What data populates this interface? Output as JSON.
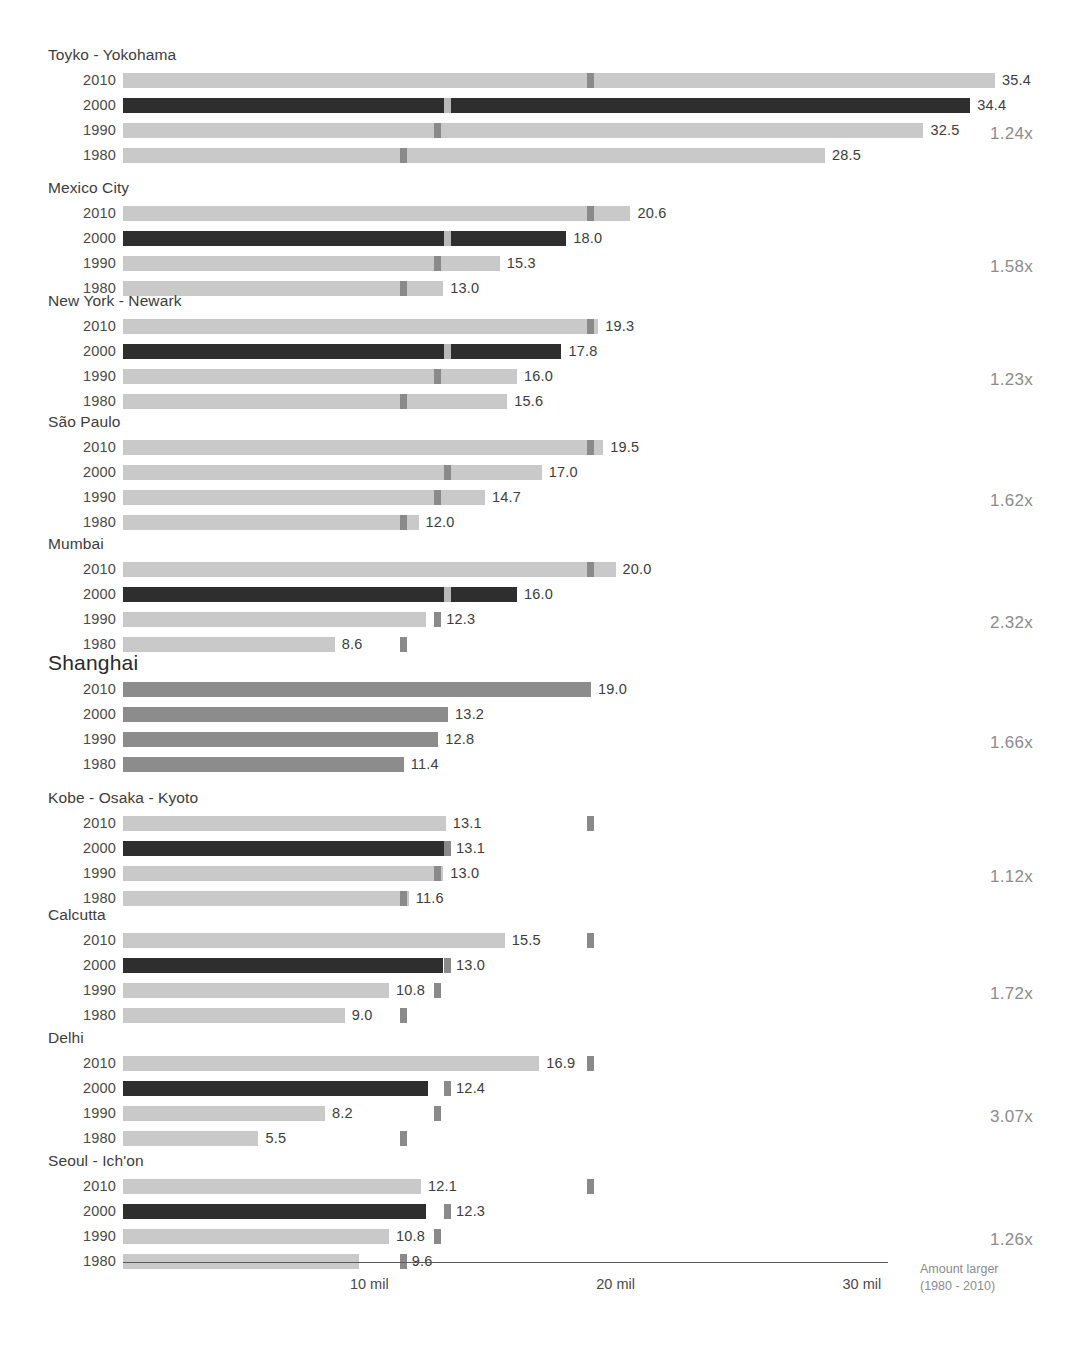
{
  "chart_data": {
    "type": "bar",
    "title": "",
    "xlabel": "",
    "ylabel": "",
    "xlim": [
      0,
      36
    ],
    "grid": false,
    "legend": "none",
    "axis_tick_labels": [
      "10 mil",
      "20 mil",
      "30 mil"
    ],
    "axis_tick_values": [
      10,
      20,
      30
    ],
    "axis_note_line1": "Amount larger",
    "axis_note_line2": "(1980 - 2010)",
    "years": [
      "2010",
      "2000",
      "1990",
      "1980"
    ],
    "reference_city": "Shanghai",
    "reference_values": {
      "2010": 19.0,
      "2000": 13.2,
      "1990": 12.8,
      "1980": 11.4
    },
    "colors": {
      "bar_light": "#c9c9c9",
      "bar_light_alt": "#c2c2c2",
      "bar_dark": "#2e2e2e",
      "bar_highlight": "#8c8c8c",
      "marker": "#8a8a8a",
      "marker_on_dark": "#b9b9b9",
      "text": "#3d3d3d",
      "muted": "#8c8c8c",
      "axis": "#5a5a5a"
    },
    "groups": [
      {
        "city": "Toyko - Yokohama",
        "highlight": false,
        "multiplier": "1.24x",
        "rows": [
          {
            "year": "2010",
            "value": 35.4,
            "label": "35.4",
            "style": "light"
          },
          {
            "year": "2000",
            "value": 34.4,
            "label": "34.4",
            "style": "dark"
          },
          {
            "year": "1990",
            "value": 32.5,
            "label": "32.5",
            "style": "light"
          },
          {
            "year": "1980",
            "value": 28.5,
            "label": "28.5",
            "style": "light"
          }
        ]
      },
      {
        "city": "Mexico City",
        "highlight": false,
        "multiplier": "1.58x",
        "rows": [
          {
            "year": "2010",
            "value": 20.6,
            "label": "20.6",
            "style": "light"
          },
          {
            "year": "2000",
            "value": 18.0,
            "label": "18.0",
            "style": "dark"
          },
          {
            "year": "1990",
            "value": 15.3,
            "label": "15.3",
            "style": "light"
          },
          {
            "year": "1980",
            "value": 13.0,
            "label": "13.0",
            "style": "light"
          }
        ]
      },
      {
        "city": "New York - Newark",
        "highlight": false,
        "multiplier": "1.23x",
        "rows": [
          {
            "year": "2010",
            "value": 19.3,
            "label": "19.3",
            "style": "light"
          },
          {
            "year": "2000",
            "value": 17.8,
            "label": "17.8",
            "style": "dark"
          },
          {
            "year": "1990",
            "value": 16.0,
            "label": "16.0",
            "style": "light"
          },
          {
            "year": "1980",
            "value": 15.6,
            "label": "15.6",
            "style": "light"
          }
        ]
      },
      {
        "city": "São Paulo",
        "highlight": false,
        "multiplier": "1.62x",
        "rows": [
          {
            "year": "2010",
            "value": 19.5,
            "label": "19.5",
            "style": "light"
          },
          {
            "year": "2000",
            "value": 17.0,
            "label": "17.0",
            "style": "light"
          },
          {
            "year": "1990",
            "value": 14.7,
            "label": "14.7",
            "style": "light"
          },
          {
            "year": "1980",
            "value": 12.0,
            "label": "12.0",
            "style": "light"
          }
        ]
      },
      {
        "city": "Mumbai",
        "highlight": false,
        "multiplier": "2.32x",
        "rows": [
          {
            "year": "2010",
            "value": 20.0,
            "label": "20.0",
            "style": "light"
          },
          {
            "year": "2000",
            "value": 16.0,
            "label": "16.0",
            "style": "dark"
          },
          {
            "year": "1990",
            "value": 12.3,
            "label": "12.3",
            "style": "light"
          },
          {
            "year": "1980",
            "value": 8.6,
            "label": "8.6",
            "style": "light"
          }
        ]
      },
      {
        "city": "Shanghai",
        "highlight": true,
        "multiplier": "1.66x",
        "rows": [
          {
            "year": "2010",
            "value": 19.0,
            "label": "19.0",
            "style": "highlight"
          },
          {
            "year": "2000",
            "value": 13.2,
            "label": "13.2",
            "style": "highlight"
          },
          {
            "year": "1990",
            "value": 12.8,
            "label": "12.8",
            "style": "highlight"
          },
          {
            "year": "1980",
            "value": 11.4,
            "label": "11.4",
            "style": "highlight"
          }
        ]
      },
      {
        "city": "Kobe - Osaka - Kyoto",
        "highlight": false,
        "multiplier": "1.12x",
        "rows": [
          {
            "year": "2010",
            "value": 13.1,
            "label": "13.1",
            "style": "light"
          },
          {
            "year": "2000",
            "value": 13.1,
            "label": "13.1",
            "style": "dark"
          },
          {
            "year": "1990",
            "value": 13.0,
            "label": "13.0",
            "style": "light"
          },
          {
            "year": "1980",
            "value": 11.6,
            "label": "11.6",
            "style": "light"
          }
        ]
      },
      {
        "city": "Calcutta",
        "highlight": false,
        "multiplier": "1.72x",
        "rows": [
          {
            "year": "2010",
            "value": 15.5,
            "label": "15.5",
            "style": "light"
          },
          {
            "year": "2000",
            "value": 13.0,
            "label": "13.0",
            "style": "dark"
          },
          {
            "year": "1990",
            "value": 10.8,
            "label": "10.8",
            "style": "light"
          },
          {
            "year": "1980",
            "value": 9.0,
            "label": "9.0",
            "style": "light"
          }
        ]
      },
      {
        "city": "Delhi",
        "highlight": false,
        "multiplier": "3.07x",
        "rows": [
          {
            "year": "2010",
            "value": 16.9,
            "label": "16.9",
            "style": "light"
          },
          {
            "year": "2000",
            "value": 12.4,
            "label": "12.4",
            "style": "dark"
          },
          {
            "year": "1990",
            "value": 8.2,
            "label": "8.2",
            "style": "light"
          },
          {
            "year": "1980",
            "value": 5.5,
            "label": "5.5",
            "style": "light"
          }
        ]
      },
      {
        "city": "Seoul - Ich'on",
        "highlight": false,
        "multiplier": "1.26x",
        "rows": [
          {
            "year": "2010",
            "value": 12.1,
            "label": "12.1",
            "style": "light"
          },
          {
            "year": "2000",
            "value": 12.3,
            "label": "12.3",
            "style": "dark"
          },
          {
            "year": "1990",
            "value": 10.8,
            "label": "10.8",
            "style": "light"
          },
          {
            "year": "1980",
            "value": 9.6,
            "label": "9.6",
            "style": "light"
          }
        ]
      }
    ]
  }
}
